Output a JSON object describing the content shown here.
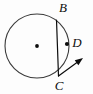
{
  "figure": {
    "type": "geometry-diagram",
    "background_color": "#fdfdfd",
    "stroke_color": "#3a3a3a",
    "ink_color": "#0d0d0d",
    "canvas": {
      "width": 93,
      "height": 94
    },
    "circle": {
      "name": "main-circle",
      "center_x": 37,
      "center_y": 46,
      "radius": 32,
      "stroke_width": 1.1
    },
    "center_point": {
      "name": "circle-center-dot",
      "x": 37,
      "y": 46,
      "radius": 1.9,
      "label": ""
    },
    "chord": {
      "name": "chord-BC",
      "x1": 56.5,
      "y1": 20,
      "x2": 58.5,
      "y2": 76,
      "stroke_width": 1.2
    },
    "ray": {
      "name": "tangent-ray-from-C",
      "x1": 58.5,
      "y1": 76,
      "x2": 83,
      "y2": 58,
      "stroke_width": 1.2,
      "arrowhead": true
    },
    "points": [
      {
        "id": "B",
        "label": "B",
        "marker": false,
        "point_x": 56.5,
        "point_y": 20,
        "label_x": 63,
        "label_y": 9
      },
      {
        "id": "D",
        "label": "D",
        "marker": true,
        "point_x": 67.0,
        "point_y": 44,
        "label_x": 77,
        "label_y": 44,
        "marker_radius": 2.1
      },
      {
        "id": "C",
        "label": "C",
        "marker": false,
        "point_x": 58.5,
        "point_y": 76,
        "label_x": 59,
        "label_y": 87
      }
    ]
  }
}
